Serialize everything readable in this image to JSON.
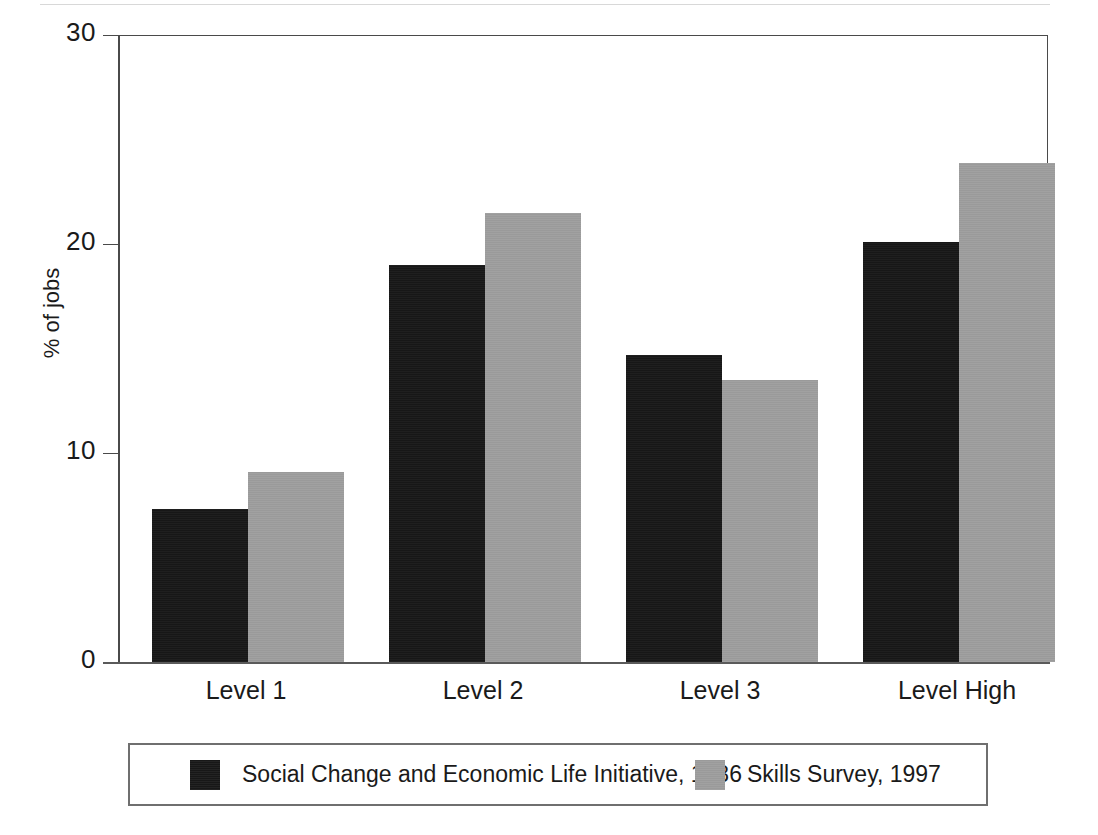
{
  "chart_data": {
    "type": "bar",
    "title": "",
    "subtitle": "",
    "xlabel": "",
    "ylabel": "% of jobs",
    "categories": [
      "Level 1",
      "Level 2",
      "Level 3",
      "Level High"
    ],
    "series": [
      {
        "name": "Social Change and Economic Life Initiative, 1986",
        "color": "#171717",
        "values": [
          7.3,
          19.0,
          14.7,
          20.1
        ]
      },
      {
        "name": "Skills Survey, 1997",
        "color": "#9a9a9a",
        "values": [
          9.1,
          21.5,
          13.5,
          23.9
        ]
      }
    ],
    "ylim": [
      0,
      30
    ],
    "yticks": [
      0,
      10,
      20,
      30
    ],
    "ytick_labels": [
      "0",
      "10",
      "20",
      "30"
    ],
    "grid": false,
    "legend_position": "bottom"
  },
  "axis": {
    "y_title": "% of jobs"
  },
  "legend": {
    "entries": [
      {
        "label": "Social Change and Economic Life Initiative, 1986",
        "color": "#171717"
      },
      {
        "label": "Skills Survey, 1997",
        "color": "#9a9a9a"
      }
    ]
  }
}
